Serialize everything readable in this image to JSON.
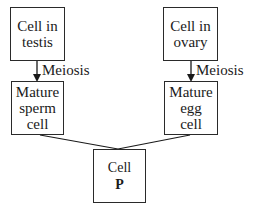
{
  "diagram": {
    "nodes": [
      {
        "id": "cell-testis",
        "lines": [
          "Cell in",
          "testis"
        ]
      },
      {
        "id": "cell-ovary",
        "lines": [
          "Cell in",
          "ovary"
        ]
      },
      {
        "id": "mature-sperm",
        "lines": [
          "Mature",
          "sperm",
          "cell"
        ]
      },
      {
        "id": "mature-egg",
        "lines": [
          "Mature",
          "egg",
          "cell"
        ]
      },
      {
        "id": "cell-p",
        "lines": [
          "Cell"
        ],
        "bold_line": "P"
      }
    ],
    "edges": [
      {
        "from": "cell-testis",
        "to": "mature-sperm",
        "label": "Meiosis",
        "arrow": true
      },
      {
        "from": "cell-ovary",
        "to": "mature-egg",
        "label": "Meiosis",
        "arrow": true
      },
      {
        "from": "mature-sperm",
        "to": "cell-p",
        "label": "",
        "arrow": false
      },
      {
        "from": "mature-egg",
        "to": "cell-p",
        "label": "",
        "arrow": false
      }
    ],
    "text": {
      "testis": "Cell in\ntestis",
      "ovary": "Cell in\novary",
      "sperm": "Mature\nsperm\ncell",
      "egg": "Mature\negg\ncell",
      "p_top": "Cell",
      "p_bold": "P",
      "meiosis_left": "Meiosis",
      "meiosis_right": "Meiosis"
    }
  }
}
